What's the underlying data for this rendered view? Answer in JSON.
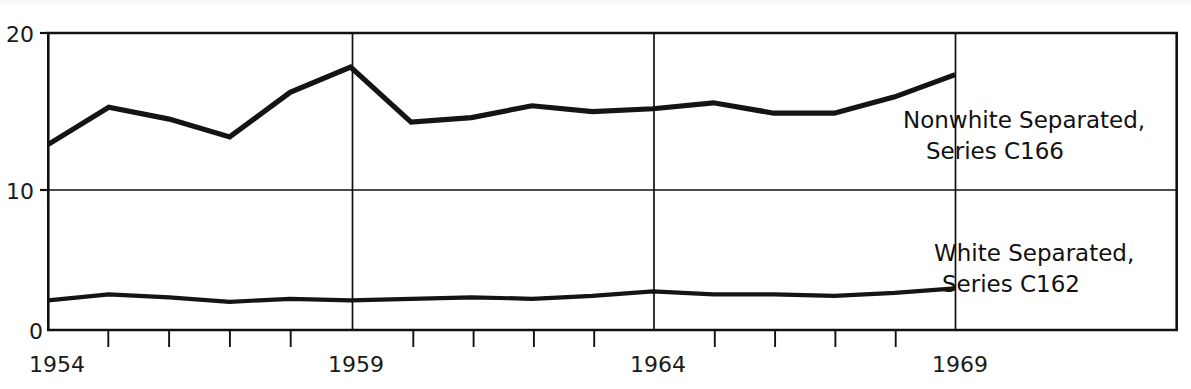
{
  "chart_data": {
    "type": "line",
    "title": "",
    "subtitle": "",
    "xlabel": "",
    "ylabel": "",
    "xlim": [
      1954,
      1972.7
    ],
    "ylim": [
      0,
      20
    ],
    "grid": "major-lines-at-y10-and-x1959-1964-1969",
    "legend_position": "inline-annotations",
    "x": [
      1954,
      1955,
      1956,
      1957,
      1958,
      1959,
      1960,
      1961,
      1962,
      1963,
      1964,
      1965,
      1966,
      1967,
      1968,
      1969
    ],
    "yticks": [
      0,
      10,
      20
    ],
    "ytick_labels": [
      "0",
      "10",
      "20"
    ],
    "xticks": [
      1954,
      1959,
      1964,
      1969
    ],
    "xtick_labels": [
      "1954",
      "1959",
      "1964",
      "1969"
    ],
    "xminor_ticks": [
      1955,
      1956,
      1957,
      1958,
      1960,
      1961,
      1962,
      1963,
      1965,
      1966,
      1967,
      1968
    ],
    "series": [
      {
        "name": "Nonwhite Separated, Series C166",
        "code": "C166",
        "color": "#141414",
        "values": [
          12.5,
          15.0,
          14.2,
          13.0,
          16.0,
          17.7,
          14.0,
          14.3,
          15.1,
          14.7,
          14.9,
          15.3,
          14.6,
          14.6,
          15.7,
          17.2
        ]
      },
      {
        "name": "White Separated, Series C162",
        "code": "C162",
        "color": "#141414",
        "values": [
          2.0,
          2.4,
          2.2,
          1.9,
          2.1,
          2.0,
          2.1,
          2.2,
          2.1,
          2.3,
          2.6,
          2.4,
          2.4,
          2.3,
          2.5,
          2.8
        ]
      }
    ],
    "annotations": [
      {
        "id": "nonwhite-label",
        "lines": [
          "Nonwhite Separated,",
          "Series C166"
        ],
        "x": 1969.2,
        "y": 14.5
      },
      {
        "id": "white-label",
        "lines": [
          "White Separated,",
          "Series C162"
        ],
        "x": 1969.2,
        "y": 6.6
      }
    ]
  },
  "axis": {
    "y_top_label": "20",
    "y_mid_label": "10",
    "y_zero_label": "0",
    "x_labels": [
      "1954",
      "1959",
      "1964",
      "1969"
    ]
  },
  "annotations": {
    "nonwhite": {
      "line1": "Nonwhite Separated,",
      "line2": "Series C166"
    },
    "white": {
      "line1": "White Separated,",
      "line2": "Series C162"
    }
  },
  "colors": {
    "line": "#141414",
    "axis": "#111111",
    "grid": "#111111",
    "background": "#ffffff"
  }
}
